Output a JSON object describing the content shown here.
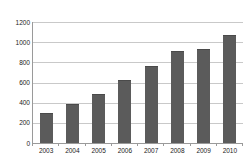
{
  "chart_data": {
    "type": "bar",
    "title": "",
    "xlabel": "",
    "ylabel": "",
    "categories": [
      "2003",
      "2004",
      "2005",
      "2006",
      "2007",
      "2008",
      "2009",
      "2010"
    ],
    "values": [
      300,
      390,
      490,
      620,
      760,
      910,
      930,
      1070
    ],
    "ylim": [
      0,
      1200
    ],
    "ytick_interval": 200,
    "ytick_labels": [
      "0",
      "200",
      "400",
      "600",
      "800",
      "1000",
      "1200"
    ],
    "grid": "horizontal",
    "legend": "none",
    "bar_color": "#5b5b5b",
    "gridline_color": "#c9c9c9",
    "axis_color": "#9a9a9a"
  }
}
